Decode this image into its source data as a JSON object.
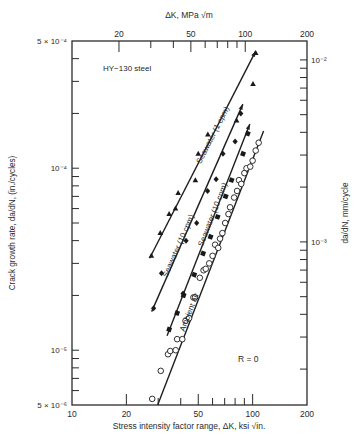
{
  "chart_data": {
    "type": "scatter",
    "title": "",
    "annotation_material": "HY−130 steel",
    "annotation_R": "R = 0",
    "xlabel": "Stress intensity factor range, ΔK, ksi √in.",
    "xlabel_top": "ΔK, MPa √m",
    "ylabel": "Crack growth rate, da/dN, (in./cycles)",
    "ylabel_right": "da/dN, mm/cycle",
    "x_scale": "log",
    "y_scale": "log",
    "xlim": [
      10,
      200
    ],
    "ylim": [
      5e-06,
      0.0005
    ],
    "x_ticks": [
      10,
      20,
      50,
      100,
      200
    ],
    "x_tick_labels": [
      "10",
      "20",
      "50",
      "100",
      "200"
    ],
    "x_top_ticks_mpa": [
      20,
      50,
      100,
      200
    ],
    "x_top_tick_labels": [
      "20",
      "50",
      "100",
      "200"
    ],
    "y_tick_labels": [
      "5 × 10⁻⁴",
      "10⁻⁴",
      "10⁻⁵",
      "5 × 10⁻⁶"
    ],
    "y_ticks": [
      0.0005,
      0.0001,
      1e-05,
      5e-06
    ],
    "y_right_ticks_mm": [
      0.01,
      0.001
    ],
    "y_right_tick_labels": [
      "10⁻²",
      "10⁻³"
    ],
    "grid": false,
    "legend": "inline line labels",
    "series": [
      {
        "name": "Seawater (1 cpm)",
        "marker": "filled-triangle",
        "line": {
          "x": [
            26.9,
            104
          ],
          "y": [
            3.2e-05,
            0.00044
          ]
        },
        "label_pos": {
          "x": 62,
          "y": 0.00015
        },
        "points": [
          {
            "x": 27.5,
            "y": 3.3e-05
          },
          {
            "x": 30.8,
            "y": 4.4e-05
          },
          {
            "x": 34.5,
            "y": 5.6e-05
          },
          {
            "x": 37.4,
            "y": 6e-05
          },
          {
            "x": 38.7,
            "y": 7.3e-05
          },
          {
            "x": 48.2,
            "y": 8.6e-05
          },
          {
            "x": 50.0,
            "y": 0.00012
          },
          {
            "x": 56.5,
            "y": 0.000153
          },
          {
            "x": 81.5,
            "y": 0.000183
          },
          {
            "x": 100.5,
            "y": 0.00029
          },
          {
            "x": 104,
            "y": 0.00043
          }
        ]
      },
      {
        "name": "Seawater (10 cpm)",
        "marker": "filled-diamond",
        "line": {
          "x": [
            27.6,
            88.3
          ],
          "y": [
            1.63e-05,
            0.000225
          ]
        },
        "label_pos": {
          "x": 40,
          "y": 3.7e-05
        },
        "points": [
          {
            "x": 28.3,
            "y": 1.7e-05
          },
          {
            "x": 31.3,
            "y": 2.65e-05
          },
          {
            "x": 41.2,
            "y": 2.05e-05
          },
          {
            "x": 42.8,
            "y": 4e-05
          },
          {
            "x": 49.0,
            "y": 5e-05
          },
          {
            "x": 56.3,
            "y": 7.5e-05
          },
          {
            "x": 62.8,
            "y": 8.7e-05
          },
          {
            "x": 68.5,
            "y": 0.00012
          },
          {
            "x": 80.0,
            "y": 0.00014
          },
          {
            "x": 86.0,
            "y": 0.0002
          }
        ]
      },
      {
        "name": "Seawater (10 cpm)",
        "marker": "filled-square",
        "line": {
          "x": [
            33.6,
            96.5
          ],
          "y": [
            1.2e-05,
            0.000175
          ]
        },
        "label_pos": {
          "x": 62,
          "y": 5.5e-05
        },
        "points": [
          {
            "x": 34.5,
            "y": 1.3e-05
          },
          {
            "x": 38.2,
            "y": 1.6e-05
          },
          {
            "x": 41.5,
            "y": 2e-05
          },
          {
            "x": 47.5,
            "y": 2.6e-05
          },
          {
            "x": 53.2,
            "y": 3.4e-05
          },
          {
            "x": 58.5,
            "y": 4.2e-05
          },
          {
            "x": 64.0,
            "y": 5.4e-05
          },
          {
            "x": 71.0,
            "y": 7e-05
          },
          {
            "x": 76.5,
            "y": 8.6e-05
          },
          {
            "x": 88.5,
            "y": 0.00012
          },
          {
            "x": 94.0,
            "y": 0.000155
          }
        ]
      },
      {
        "name": "Ambient air",
        "marker": "open-circle",
        "line": {
          "x": [
            29.8,
            115
          ],
          "y": [
            5e-06,
            0.00016
          ]
        },
        "label_pos": {
          "x": 46,
          "y": 1.6e-05
        },
        "points": [
          {
            "x": 27.8,
            "y": 5.4e-06
          },
          {
            "x": 31.0,
            "y": 7.7e-06
          },
          {
            "x": 34.0,
            "y": 9.5e-06
          },
          {
            "x": 35.0,
            "y": 9.9e-06
          },
          {
            "x": 37.5,
            "y": 1e-05
          },
          {
            "x": 38.2,
            "y": 1.15e-05
          },
          {
            "x": 40.8,
            "y": 1.15e-05
          },
          {
            "x": 42.5,
            "y": 1.45e-05
          },
          {
            "x": 44.5,
            "y": 1.5e-05
          },
          {
            "x": 47.0,
            "y": 1.95e-05
          },
          {
            "x": 48.0,
            "y": 1.95e-05
          },
          {
            "x": 51.0,
            "y": 2.5e-05
          },
          {
            "x": 53.5,
            "y": 2.75e-05
          },
          {
            "x": 55.0,
            "y": 2.8e-05
          },
          {
            "x": 57.5,
            "y": 3e-05
          },
          {
            "x": 60.0,
            "y": 3.3e-05
          },
          {
            "x": 62.0,
            "y": 3.8e-05
          },
          {
            "x": 64.5,
            "y": 3.65e-05
          },
          {
            "x": 66.0,
            "y": 4.1e-05
          },
          {
            "x": 68.0,
            "y": 4.4e-05
          },
          {
            "x": 70.5,
            "y": 5e-05
          },
          {
            "x": 73.5,
            "y": 5.6e-05
          },
          {
            "x": 75.0,
            "y": 6.1e-05
          },
          {
            "x": 79.0,
            "y": 6.9e-05
          },
          {
            "x": 82.0,
            "y": 7.5e-05
          },
          {
            "x": 84.0,
            "y": 8.6e-05
          },
          {
            "x": 86.5,
            "y": 8.2e-05
          },
          {
            "x": 90.0,
            "y": 9.4e-05
          },
          {
            "x": 92.5,
            "y": 0.0001
          },
          {
            "x": 97.0,
            "y": 0.000102
          },
          {
            "x": 100.0,
            "y": 0.00011
          },
          {
            "x": 104.0,
            "y": 0.000125
          },
          {
            "x": 108.0,
            "y": 0.000138
          }
        ]
      }
    ]
  },
  "frame": {
    "left": 72,
    "right": 307,
    "top": 41,
    "bottom": 405
  }
}
